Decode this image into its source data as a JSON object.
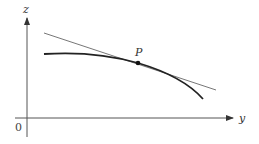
{
  "diagram": {
    "axes": {
      "horizontal_label": "y",
      "vertical_label": "z",
      "origin_label": "0"
    },
    "point": {
      "label": "P"
    },
    "elements": [
      "z-axis",
      "y-axis",
      "curve",
      "tangent-line",
      "point-P"
    ],
    "colors": {
      "axis": "#555555",
      "curve": "#222222",
      "tangent": "#666666",
      "point": "#111111"
    }
  }
}
